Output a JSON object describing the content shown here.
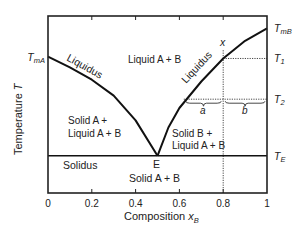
{
  "chart_data": {
    "type": "line",
    "title": "",
    "xlabel": "Composition x_B",
    "xlabel_main": "Composition ",
    "xlabel_var": "x",
    "xlabel_sub": "B",
    "ylabel": "Temperature T",
    "ylabel_main": "Temperature ",
    "ylabel_var": "T",
    "xlim": [
      0,
      1
    ],
    "x_ticks": [
      "0",
      "0.2",
      "0.4",
      "0.6",
      "0.8",
      "1"
    ],
    "x_tick_values": [
      0,
      0.2,
      0.4,
      0.6,
      0.8,
      1
    ],
    "y_scale_note": "relative temperature, 0 = bottom, 1 = top of frame",
    "ylim": [
      0,
      1
    ],
    "levels": {
      "T_mA": 0.77,
      "T_mB": 0.93,
      "T1": 0.76,
      "T2": 0.53,
      "T_E": 0.21
    },
    "series": [
      {
        "name": "Liquidus (A side)",
        "x": [
          0,
          0.1,
          0.2,
          0.3,
          0.4,
          0.5
        ],
        "y": [
          0.77,
          0.71,
          0.64,
          0.55,
          0.41,
          0.21
        ]
      },
      {
        "name": "Liquidus (B side)",
        "x": [
          0.5,
          0.55,
          0.6,
          0.7,
          0.8,
          0.9,
          1.0
        ],
        "y": [
          0.21,
          0.37,
          0.48,
          0.63,
          0.76,
          0.86,
          0.93
        ]
      },
      {
        "name": "Solidus",
        "x": [
          0,
          1
        ],
        "y": [
          0.21,
          0.21
        ]
      }
    ],
    "eutectic": {
      "x": 0.5,
      "label": "E"
    },
    "composition_line": {
      "x": 0.8,
      "label": "x"
    },
    "lever_segments": [
      {
        "label": "a",
        "from": 0.62,
        "to": 0.8
      },
      {
        "label": "b",
        "from": 0.8,
        "to": 1.0
      }
    ],
    "right_labels": [
      {
        "key": "T_mB",
        "main": "T",
        "sub": "mB"
      },
      {
        "key": "T1",
        "main": "T",
        "sub": "1"
      },
      {
        "key": "T2",
        "main": "T",
        "sub": "2"
      },
      {
        "key": "T_E",
        "main": "T",
        "sub": "E"
      }
    ],
    "left_labels": [
      {
        "key": "T_mA",
        "main": "T",
        "sub": "mA"
      }
    ],
    "region_labels": {
      "liquid": "Liquid A + B",
      "liquidus_left": "Liquidus",
      "liquidus_right": "Liquidus",
      "solid_a_line1": "Solid A +",
      "solid_a_line2": "Liquid A + B",
      "solid_b_line1": "Solid B +",
      "solid_b_line2": "Liquid A + B",
      "solidus": "Solidus",
      "solid": "Solid A + B"
    }
  }
}
